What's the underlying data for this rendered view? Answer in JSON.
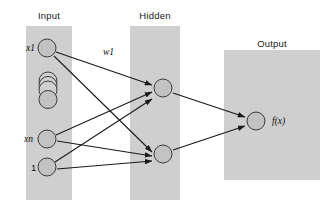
{
  "figure": {
    "type": "neural-network-diagram",
    "background_color": "#ffffff",
    "band_color": "#cfcfcf",
    "node_fill_color": "#c2c2c2",
    "node_stroke_color": "#3a3a3a",
    "edge_color": "#1a1a1a"
  },
  "layers": {
    "input": {
      "title": "Input",
      "band": {
        "x": 26,
        "y": 26,
        "width": 46,
        "height": 174
      },
      "title_pos": {
        "x": 26,
        "y": 10,
        "width": 46
      },
      "nodes": [
        {
          "id": "x1",
          "label": "x1",
          "cx": 47,
          "cy": 48,
          "r": 9,
          "label_x": 26,
          "label_y": 43
        },
        {
          "id": "dots",
          "label": "",
          "cx": 48,
          "cy": 95,
          "r": 9,
          "label_x": 0,
          "label_y": 0,
          "stack": true
        },
        {
          "id": "xn",
          "label": "xn",
          "cx": 47,
          "cy": 139,
          "r": 9,
          "label_x": 24,
          "label_y": 134
        },
        {
          "id": "bias",
          "label": "1",
          "cx": 47,
          "cy": 167,
          "r": 9,
          "label_x": 31,
          "label_y": 162
        }
      ]
    },
    "hidden": {
      "title": "Hidden",
      "band": {
        "x": 130,
        "y": 26,
        "width": 50,
        "height": 174
      },
      "title_pos": {
        "x": 128,
        "y": 10,
        "width": 54
      },
      "nodes": [
        {
          "id": "h1",
          "label": "",
          "cx": 163,
          "cy": 88,
          "r": 9
        },
        {
          "id": "h2",
          "label": "",
          "cx": 163,
          "cy": 154,
          "r": 9
        }
      ]
    },
    "output": {
      "title": "Output",
      "band": {
        "x": 224,
        "y": 50,
        "width": 96,
        "height": 130
      },
      "title_pos": {
        "x": 246,
        "y": 38,
        "width": 52
      },
      "nodes": [
        {
          "id": "out",
          "label": "f(x)",
          "cx": 256,
          "cy": 121,
          "r": 9,
          "label_x": 272,
          "label_y": 116
        }
      ]
    }
  },
  "edges": [
    {
      "id": "x1-h1",
      "from": "x1",
      "to": "h1",
      "x1": 56,
      "y1": 52,
      "x2": 152,
      "y2": 85,
      "label": "w1"
    },
    {
      "id": "x1-h2",
      "from": "x1",
      "to": "h2",
      "x1": 54,
      "y1": 56,
      "x2": 152,
      "y2": 152
    },
    {
      "id": "xn-h1",
      "from": "xn",
      "to": "h1",
      "x1": 56,
      "y1": 135,
      "x2": 152,
      "y2": 92
    },
    {
      "id": "xn-h2",
      "from": "xn",
      "to": "h2",
      "x1": 57,
      "y1": 141,
      "x2": 152,
      "y2": 156
    },
    {
      "id": "bias-h1",
      "from": "bias",
      "to": "h1",
      "x1": 55,
      "y1": 162,
      "x2": 152,
      "y2": 99
    },
    {
      "id": "bias-h2",
      "from": "bias",
      "to": "h2",
      "x1": 57,
      "y1": 169,
      "x2": 152,
      "y2": 161
    },
    {
      "id": "h1-out",
      "from": "h1",
      "to": "out",
      "x1": 173,
      "y1": 93,
      "x2": 245,
      "y2": 117
    },
    {
      "id": "h2-out",
      "from": "h2",
      "to": "out",
      "x1": 173,
      "y1": 150,
      "x2": 245,
      "y2": 126
    }
  ],
  "edge_labels": [
    {
      "id": "w1",
      "text": "w1",
      "x": 103,
      "y": 47
    }
  ]
}
